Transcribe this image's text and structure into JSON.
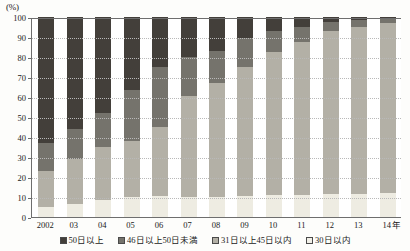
{
  "chart_data": {
    "type": "bar",
    "stacked": true,
    "stack_mode": "percent",
    "title": "",
    "subtitle": "",
    "xlabel": "年",
    "ylabel": "",
    "yunit": "(%)",
    "ylim": [
      0,
      100
    ],
    "yticks": [
      0,
      10,
      20,
      30,
      40,
      50,
      60,
      70,
      80,
      90,
      100
    ],
    "grid": true,
    "legend_position": "bottom",
    "categories": [
      "2002",
      "03",
      "04",
      "05",
      "06",
      "07",
      "08",
      "09",
      "10",
      "11",
      "12",
      "13",
      "14"
    ],
    "series": [
      {
        "name": "30日以内",
        "color": "#eeece2",
        "values": [
          5.0,
          6.5,
          8.5,
          10.0,
          10.5,
          10.0,
          10.0,
          10.5,
          11.0,
          11.0,
          11.5,
          11.5,
          12.0
        ]
      },
      {
        "name": "31日以上45日以内",
        "color": "#b3b0a6",
        "values": [
          18.0,
          22.5,
          26.5,
          28.0,
          34.5,
          50.5,
          57.0,
          64.5,
          71.5,
          76.5,
          81.5,
          83.5,
          85.0
        ]
      },
      {
        "name": "46日以上50日未満",
        "color": "#75736c",
        "values": [
          14.0,
          15.0,
          17.0,
          25.5,
          30.0,
          19.5,
          16.0,
          14.5,
          10.5,
          7.5,
          4.5,
          3.5,
          2.0
        ]
      },
      {
        "name": "50日以上",
        "color": "#433f3a",
        "values": [
          63.0,
          56.0,
          48.0,
          36.5,
          25.0,
          20.0,
          17.0,
          10.5,
          7.0,
          5.0,
          2.5,
          1.5,
          1.0
        ]
      }
    ],
    "cumulative_tops": {
      "2002": [
        5.0,
        23.0,
        37.0,
        100.0
      ],
      "03": [
        6.5,
        29.0,
        44.0,
        100.0
      ],
      "04": [
        8.5,
        35.0,
        52.0,
        100.0
      ],
      "05": [
        10.0,
        38.0,
        63.5,
        100.0
      ],
      "06": [
        10.5,
        45.0,
        75.0,
        100.0
      ],
      "07": [
        10.0,
        60.5,
        80.0,
        100.0
      ],
      "08": [
        10.0,
        67.0,
        83.0,
        100.0
      ],
      "09": [
        10.5,
        75.0,
        89.5,
        100.0
      ],
      "10": [
        11.0,
        82.5,
        93.0,
        100.0
      ],
      "11": [
        11.0,
        87.5,
        95.0,
        100.0
      ],
      "12": [
        11.5,
        93.0,
        97.5,
        100.0
      ],
      "13": [
        11.5,
        95.0,
        98.5,
        100.0
      ],
      "14": [
        12.0,
        97.0,
        99.0,
        100.0
      ]
    }
  },
  "axis": {
    "unit_label": "(%)",
    "x_unit_label": "年",
    "ytick_labels": [
      "100",
      "90",
      "80",
      "70",
      "60",
      "50",
      "40",
      "30",
      "20",
      "10",
      "0"
    ],
    "xtick_labels": [
      "2002",
      "03",
      "04",
      "05",
      "06",
      "07",
      "08",
      "09",
      "10",
      "11",
      "12",
      "13",
      "14"
    ]
  },
  "legend": {
    "items": [
      {
        "label": "50日以上",
        "color": "#433f3a"
      },
      {
        "label": "46日以上50日未満",
        "color": "#75736c"
      },
      {
        "label": "31日以上45日以内",
        "color": "#b3b0a6"
      },
      {
        "label": "30日以内",
        "color": "#f2f0e8"
      }
    ]
  }
}
